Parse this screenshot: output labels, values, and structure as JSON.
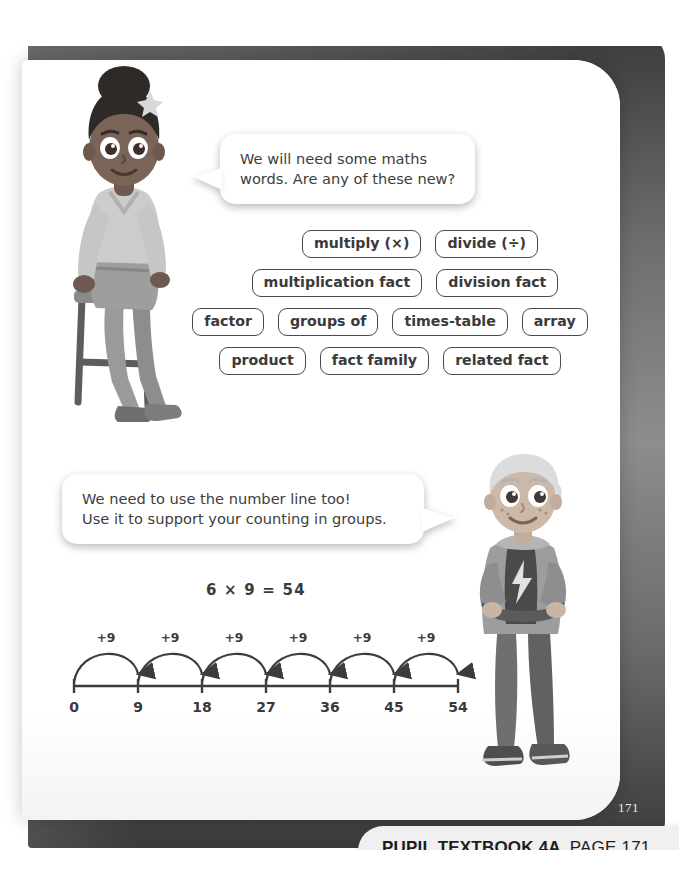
{
  "page": {
    "corner_page_number": "171",
    "background_color": "#6e6e6e",
    "sheet_color": "#ffffff",
    "ink_color": "#3c3c3c"
  },
  "speech_bubbles": [
    {
      "id": "girl-bubble",
      "speaker": "girl",
      "text": "We will need some maths\nwords. Are any of these new?",
      "tail": "left"
    },
    {
      "id": "boy-bubble",
      "speaker": "boy",
      "text": "We need to use the number line too!\nUse it to support your counting in groups.",
      "tail": "right"
    }
  ],
  "vocabulary": {
    "rows": [
      {
        "chips": [
          "multiply (×)",
          "divide (÷)"
        ]
      },
      {
        "chips": [
          "multiplication fact",
          "division fact"
        ]
      },
      {
        "chips": [
          "factor",
          "groups of",
          "times-table",
          "array"
        ]
      },
      {
        "chips": [
          "product",
          "fact family",
          "related fact"
        ]
      }
    ]
  },
  "number_line": {
    "equation": "6 × 9 = 54",
    "jump_label": "+9",
    "jump_count": 6,
    "ticks": [
      "0",
      "9",
      "18",
      "27",
      "36",
      "45",
      "54"
    ]
  },
  "chart_data": {
    "type": "line",
    "title": "6 × 9 = 54",
    "xlabel": "",
    "ylabel": "",
    "categories": [
      "0",
      "9",
      "18",
      "27",
      "36",
      "45",
      "54"
    ],
    "values": [
      0,
      9,
      18,
      27,
      36,
      45,
      54
    ],
    "annotations": [
      "+9",
      "+9",
      "+9",
      "+9",
      "+9",
      "+9"
    ],
    "xlim": [
      0,
      54
    ],
    "grid": false,
    "legend": "none"
  },
  "characters": [
    {
      "id": "girl-on-stool",
      "description": "girl sitting on a stool"
    },
    {
      "id": "boy-standing",
      "description": "boy standing with arms crossed"
    }
  ],
  "footer": {
    "book_label": "PUPIL TEXTBOOK 4A",
    "page_label": "PAGE 171"
  }
}
